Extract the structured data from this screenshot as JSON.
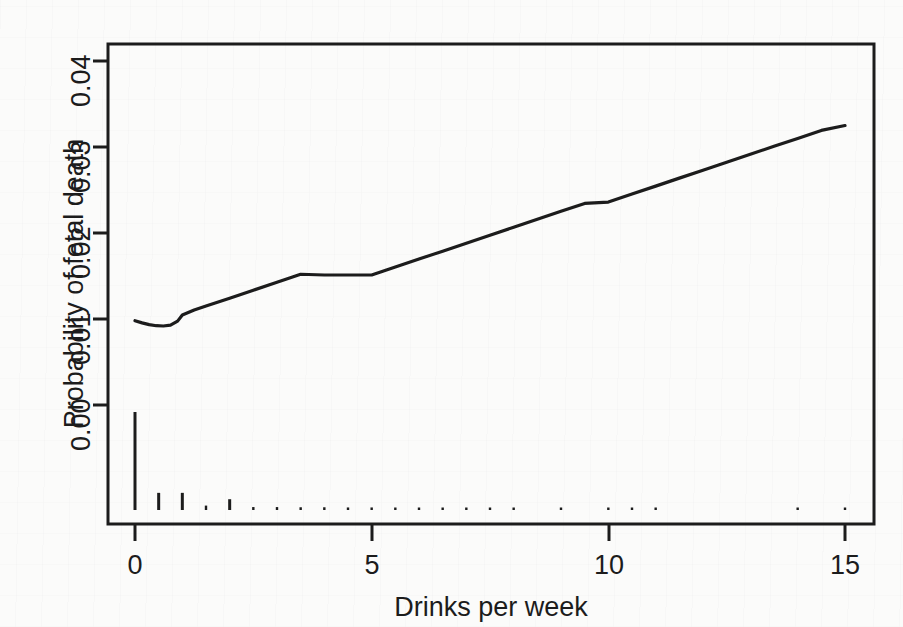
{
  "figure": {
    "background_color": "#fbfbfa",
    "ink_color": "#1c1c1c",
    "kind": "statistical-regression-plot"
  },
  "chart_data": {
    "type": "line",
    "title": "",
    "subtitle": "",
    "xlabel": "Drinks per week",
    "ylabel": "Probability of fetal death",
    "xlim": [
      -0.55,
      15.6
    ],
    "ylim": [
      -0.0118,
      0.0425
    ],
    "xticks": [
      0,
      5,
      10,
      15
    ],
    "xticklabels": [
      "0",
      "5",
      "10",
      "15"
    ],
    "yticks": [
      0.0,
      0.01,
      0.02,
      0.03,
      0.04
    ],
    "yticklabels": [
      "0.00",
      "0.01",
      "0.02",
      "0.03",
      "0.04"
    ],
    "grid": false,
    "legend": null,
    "box_frame": true,
    "series": [
      {
        "name": "Fitted probability of fetal death",
        "type": "line",
        "color": "#1c1c1c",
        "linewidth": 2.2,
        "x": [
          0.0,
          0.15,
          0.3,
          0.45,
          0.6,
          0.75,
          0.9,
          1.0,
          1.25,
          1.5,
          2.0,
          2.5,
          3.0,
          3.5,
          4.0,
          4.5,
          5.0,
          5.5,
          6.0,
          6.5,
          7.0,
          7.5,
          8.0,
          8.5,
          9.0,
          9.5,
          10.0,
          10.5,
          11.0,
          11.5,
          12.0,
          12.5,
          13.0,
          13.5,
          14.0,
          14.5,
          15.0
        ],
        "y": [
          0.0098,
          0.00955,
          0.00935,
          0.00922,
          0.00919,
          0.00928,
          0.00975,
          0.01047,
          0.01105,
          0.0115,
          0.01242,
          0.01335,
          0.01427,
          0.0152,
          0.01512,
          0.01512,
          0.01512,
          0.01604,
          0.01697,
          0.01789,
          0.01882,
          0.01974,
          0.02067,
          0.02159,
          0.02252,
          0.02344,
          0.0236,
          0.02453,
          0.02545,
          0.02638,
          0.0273,
          0.02823,
          0.02915,
          0.03008,
          0.031,
          0.03193,
          0.0325
        ]
      },
      {
        "name": "Data density rug (spikes)",
        "type": "rug-spikes",
        "color": "#1c1c1c",
        "note": "vertical spikes drawn below the 0.00 gridline; height encodes observation count",
        "x": [
          0.0,
          0.5,
          1.0,
          1.5,
          2.0,
          2.5,
          3.0,
          3.5,
          4.0,
          4.5,
          5.0,
          5.5,
          6.0,
          6.5,
          7.0,
          7.5,
          8.0,
          9.0,
          10.0,
          10.5,
          11.0,
          14.0,
          15.0
        ],
        "height": [
          1.0,
          0.175,
          0.175,
          0.045,
          0.11,
          0.03,
          0.03,
          0.028,
          0.028,
          0.026,
          0.026,
          0.024,
          0.024,
          0.022,
          0.022,
          0.02,
          0.02,
          0.018,
          0.018,
          0.016,
          0.016,
          0.014,
          0.014
        ]
      }
    ],
    "annotations": [
      {
        "text": "curve minimum near 0.5 drinks/week",
        "x": 0.6,
        "y": 0.00919,
        "visible": false
      }
    ],
    "readings": {
      "at_x_0": 0.0098,
      "at_x_0p5_minimum": 0.0092,
      "at_x_1": 0.0105,
      "at_x_5": 0.0151,
      "at_x_10": 0.0236,
      "at_x_15": 0.0325
    }
  },
  "axes": {
    "x_title": "Drinks per week",
    "y_title": "Probability of fetal death",
    "x_tick_labels": [
      "0",
      "5",
      "10",
      "15"
    ],
    "y_tick_labels": [
      "0.00",
      "0.01",
      "0.02",
      "0.03",
      "0.04"
    ]
  }
}
